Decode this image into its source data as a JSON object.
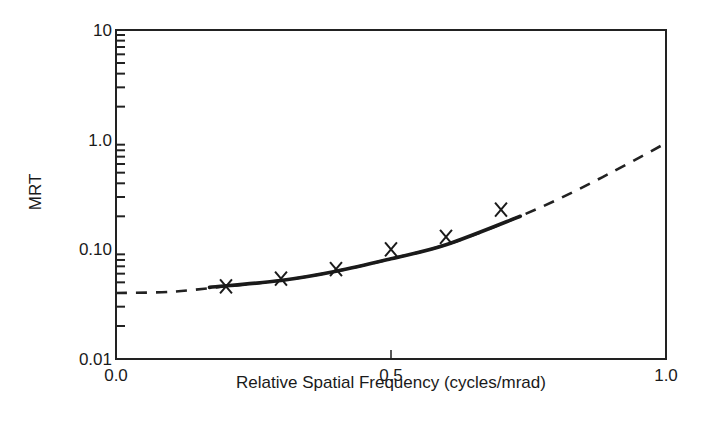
{
  "chart_data": {
    "type": "line",
    "title": "",
    "xlabel": "Relative Spatial Frequency (cycles/mrad)",
    "ylabel": "MRT",
    "xlim": [
      0.0,
      1.0
    ],
    "ylim": [
      0.01,
      10
    ],
    "yscale": "log",
    "grid": false,
    "legend": null,
    "x_ticks": [
      {
        "value": 0.0,
        "label": "0.0"
      },
      {
        "value": 0.5,
        "label": "0.5"
      },
      {
        "value": 1.0,
        "label": "1.0"
      }
    ],
    "y_ticks": [
      {
        "value": 0.01,
        "label": "0.01"
      },
      {
        "value": 0.1,
        "label": "0.10"
      },
      {
        "value": 1.0,
        "label": "1.0"
      },
      {
        "value": 10,
        "label": "10"
      }
    ],
    "series": [
      {
        "name": "Measured MRT",
        "style": "markers",
        "marker": "x",
        "x": [
          0.2,
          0.3,
          0.4,
          0.5,
          0.6,
          0.7
        ],
        "y": [
          0.046,
          0.054,
          0.066,
          0.1,
          0.13,
          0.23
        ]
      },
      {
        "name": "Model fit (within data range)",
        "style": "solid",
        "x": [
          0.17,
          0.3,
          0.4,
          0.5,
          0.6,
          0.735
        ],
        "y": [
          0.045,
          0.052,
          0.063,
          0.082,
          0.11,
          0.2
        ]
      },
      {
        "name": "Model extrapolation",
        "style": "dashed",
        "x": [
          0.0,
          0.1,
          0.2,
          0.3,
          0.4,
          0.5,
          0.6,
          0.7,
          0.8,
          0.9,
          1.0
        ],
        "y": [
          0.04,
          0.041,
          0.046,
          0.052,
          0.063,
          0.082,
          0.11,
          0.17,
          0.28,
          0.5,
          0.93
        ]
      }
    ]
  }
}
